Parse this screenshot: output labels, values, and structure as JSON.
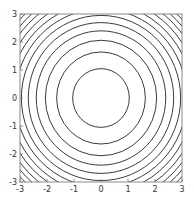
{
  "chart_data": {
    "type": "contour",
    "title": "",
    "xlabel": "",
    "ylabel": "",
    "function": "x^2 + y^2",
    "xlim": [
      -3,
      3
    ],
    "ylim": [
      -3,
      3
    ],
    "x_ticks": [
      -3,
      -2,
      -1,
      0,
      1,
      2,
      3
    ],
    "y_ticks": [
      -3,
      -2,
      -1,
      0,
      1,
      2,
      3
    ],
    "x_tick_labels": [
      "-3",
      "-2",
      "-1",
      "0",
      "1",
      "2",
      "3"
    ],
    "y_tick_labels": [
      "-3",
      "-2",
      "-1",
      "0",
      "1",
      "2",
      "3"
    ],
    "contour_levels": [
      1.1,
      2.7,
      4.25,
      5.75,
      7.25,
      8.7,
      10.1,
      11.5,
      12.9,
      14.3,
      15.6,
      16.9
    ],
    "center": [
      0,
      0
    ],
    "grid": false,
    "legend": false,
    "colors": {
      "contour": "#3c3c3c",
      "frame": "#8a8a8a",
      "background": "#ffffff",
      "text": "#333333"
    }
  }
}
